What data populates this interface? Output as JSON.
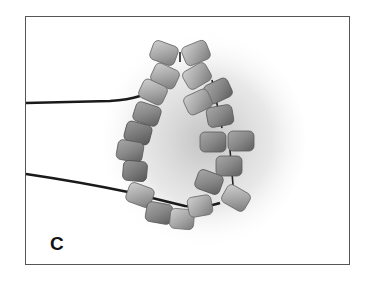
{
  "figure": {
    "panel_label": "C",
    "colors": {
      "background": "#ffffff",
      "border": "#555555",
      "thread": "#1a1a1a",
      "bead_light": "#b8b8b8",
      "bead_mid": "#8a8a8a",
      "bead_dark": "#6a6a6a"
    }
  }
}
